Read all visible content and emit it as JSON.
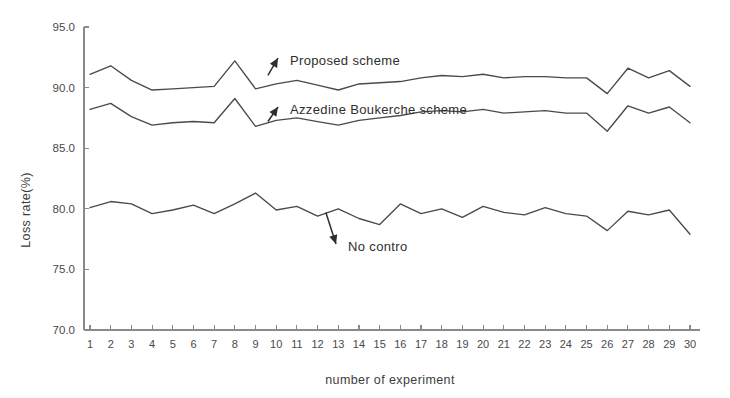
{
  "chart_data": {
    "type": "line",
    "title": "",
    "xlabel": "number of experiment",
    "ylabel": "Loss rate(%)",
    "xlim": [
      1,
      30
    ],
    "ylim": [
      70.0,
      95.0
    ],
    "yticks": [
      70.0,
      75.0,
      80.0,
      85.0,
      90.0,
      95.0
    ],
    "ytick_labels": [
      "70.0",
      "75.0",
      "80.0",
      "85.0",
      "90.0",
      "95.0"
    ],
    "grid": false,
    "legend_position": "inline-annotations",
    "x": [
      1,
      2,
      3,
      4,
      5,
      6,
      7,
      8,
      9,
      10,
      11,
      12,
      13,
      14,
      15,
      16,
      17,
      18,
      19,
      20,
      21,
      22,
      23,
      24,
      25,
      26,
      27,
      28,
      29,
      30
    ],
    "xtick_labels": [
      "1",
      "2",
      "3",
      "4",
      "5",
      "6",
      "7",
      "8",
      "9",
      "10",
      "11",
      "12",
      "13",
      "14",
      "15",
      "16",
      "17",
      "18",
      "19",
      "20",
      "21",
      "22",
      "23",
      "24",
      "25",
      "26",
      "27",
      "28",
      "29",
      "30"
    ],
    "series": [
      {
        "name": "Proposed scheme",
        "values": [
          91.1,
          91.8,
          90.6,
          89.8,
          89.9,
          90.0,
          90.1,
          92.2,
          89.9,
          90.3,
          90.6,
          90.2,
          89.8,
          90.3,
          90.4,
          90.5,
          90.8,
          91.0,
          90.9,
          91.1,
          90.8,
          90.9,
          90.9,
          90.8,
          90.8,
          89.5,
          91.6,
          90.8,
          91.4,
          90.1
        ]
      },
      {
        "name": "Azzedine Boukerche scheme",
        "values": [
          88.2,
          88.7,
          87.6,
          86.9,
          87.1,
          87.2,
          87.1,
          89.1,
          86.8,
          87.3,
          87.5,
          87.2,
          86.9,
          87.3,
          87.5,
          87.7,
          88.0,
          88.1,
          88.0,
          88.2,
          87.9,
          88.0,
          88.1,
          87.9,
          87.9,
          86.4,
          88.5,
          87.9,
          88.4,
          87.1
        ]
      },
      {
        "name": "No contro",
        "values": [
          80.1,
          80.6,
          80.4,
          79.6,
          79.9,
          80.3,
          79.6,
          80.4,
          81.3,
          79.9,
          80.2,
          79.4,
          80.0,
          79.2,
          78.7,
          80.4,
          79.6,
          80.0,
          79.3,
          80.2,
          79.7,
          79.5,
          80.1,
          79.6,
          79.4,
          78.2,
          79.8,
          79.5,
          79.9,
          77.9
        ]
      }
    ],
    "annotations": [
      {
        "text": "Proposed scheme",
        "target_x": 9.6,
        "target_y": 91.0,
        "label_x": 290,
        "label_y": 61
      },
      {
        "text": "Azzedine Boukerche scheme",
        "target_x": 9.6,
        "target_y": 87.2,
        "label_x": 290,
        "label_y": 110
      },
      {
        "text": "No contro",
        "target_x": 12.4,
        "target_y": 79.7,
        "label_x": 348,
        "label_y": 247
      }
    ]
  },
  "colors": {
    "line": "#4a4a4a",
    "axis": "#8a8a8a",
    "text": "#3a3a3a",
    "background": "#ffffff"
  }
}
